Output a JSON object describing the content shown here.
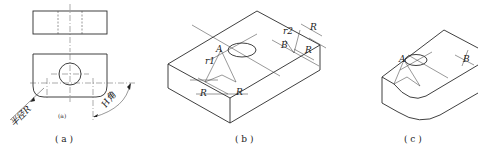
{
  "figure": {
    "panels": [
      {
        "id": "a",
        "caption": "( a )",
        "sub_caption": "(a)",
        "description": "Orthographic top and front views of block with hole and rounded corners",
        "labels": {
          "radius": "半径R",
          "angle": "H角"
        }
      },
      {
        "id": "b",
        "caption": "( b )",
        "description": "Isometric construction of the block showing arc centers A and B",
        "labels": {
          "point_a": "A",
          "point_b": "B",
          "r1": "r1",
          "r2": "r2",
          "radius": "R"
        }
      },
      {
        "id": "c",
        "caption": "( c )",
        "description": "Finished isometric view with rounded corners",
        "labels": {
          "point_a": "A",
          "point_b": "B"
        }
      }
    ]
  },
  "colors": {
    "line": "#2a2a2a",
    "background": "#ffffff"
  }
}
